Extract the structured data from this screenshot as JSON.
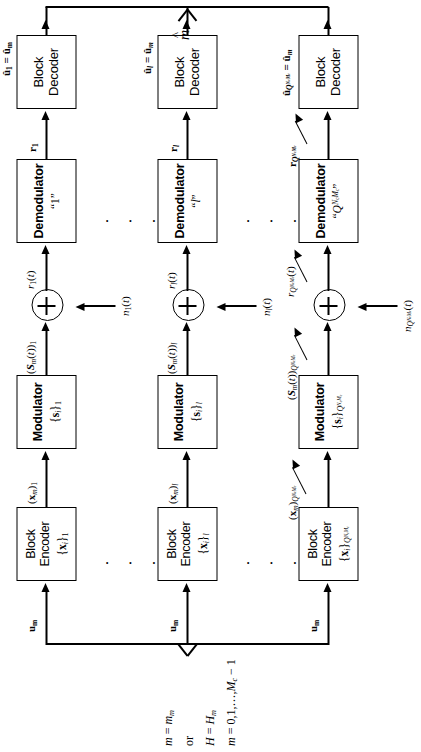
{
  "figure": {
    "type": "block-diagram",
    "orientation": "rotated-90",
    "title_label": "m̂",
    "branch_count_shown": 3,
    "ellipsis": "·  ·  ·"
  },
  "input": {
    "lines": [
      "m = mₘ",
      "or",
      "H = Hₘ",
      "m = 0,1,…,M_c − 1"
    ],
    "branch_input_label": "uₘ"
  },
  "output": {
    "combined_label": "m̂"
  },
  "blocks": {
    "encoder_title_line1": "Block",
    "encoder_title_line2": "Encoder",
    "modulator_title": "Modulator",
    "demodulator_title": "Demodulator",
    "decoder_title_line1": "Block",
    "decoder_title_line2": "Decoder"
  },
  "branches": [
    {
      "id": "branch-1",
      "index_label": "1",
      "encoder_sub": "{xᵢ}₁",
      "encoder_in": "uₘ",
      "encoder_out": "(xₘ)₁",
      "modulator_sub": "{sᵢ}₁",
      "modulator_out": "(Sₘ(t))₁",
      "noise": "n₁(t)",
      "adder_out": "r₁(t)",
      "demodulator_sub": "“1”",
      "demodulator_out": "r₁",
      "decoder_out": "û₁ = ûₘ"
    },
    {
      "id": "branch-l",
      "index_label": "l",
      "encoder_sub": "{xᵢ}ₗ",
      "encoder_in": "uₘ",
      "encoder_out": "(xₘ)ₗ",
      "modulator_sub": "{sᵢ}ₗ",
      "modulator_out": "(Sₘ(t))ₗ",
      "noise": "nₗ(t)",
      "adder_out": "rₗ(t)",
      "demodulator_sub": "“l”",
      "demodulator_out": "rₗ",
      "decoder_out": "ûₗ = ûₘ"
    },
    {
      "id": "branch-Q",
      "index_label": "Q^{N_c M_c}",
      "encoder_sub": "{xᵢ}_{Q^{N_c M_c}}",
      "encoder_in": "uₘ",
      "encoder_out": "(xₘ)_{Q^{N_c M_c}}",
      "modulator_sub": "{sᵢ}_{Q^{N_c M_c}}",
      "modulator_out": "(Sₘ(t))_{Q^{N_c M_c}}",
      "noise": "n_{Q^{N_c M_c}}(t)",
      "adder_out": "r_{Q^{N_c M_c}}(t)",
      "demodulator_sub": "“Q^{N_c M_c}”",
      "demodulator_out": "r_{Q^{N_c M_c}}",
      "decoder_out": "û_{Q^{N_c M_c}} = ûₘ"
    }
  ],
  "colors": {
    "stroke": "#000000",
    "background": "#ffffff"
  }
}
